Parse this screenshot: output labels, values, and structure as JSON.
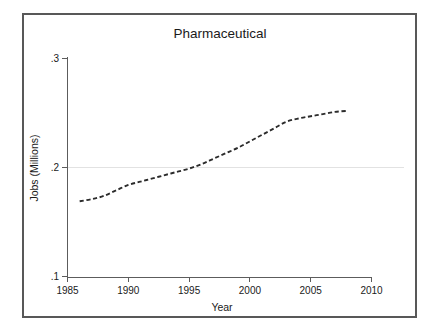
{
  "chart_data": {
    "type": "line",
    "title": "Pharmaceutical",
    "xlabel": "Year",
    "ylabel": "Jobs (Millions)",
    "xlim": [
      1985,
      2010
    ],
    "ylim": [
      0.1,
      0.3
    ],
    "xticks": [
      "1985",
      "1990",
      "1995",
      "2000",
      "2005",
      "2010"
    ],
    "xtick_values": [
      1985,
      1990,
      1995,
      2000,
      2005,
      2010
    ],
    "yticks": [
      ".1",
      ".2",
      ".3"
    ],
    "ytick_values": [
      0.1,
      0.2,
      0.3
    ],
    "grid": "horizontal-gridline-at-0.2-only",
    "legend": "none",
    "line_style": "dashed",
    "line_color": "#2b2b2b",
    "series": [
      {
        "name": "Pharmaceutical jobs",
        "x": [
          1986,
          1987,
          1988,
          1989,
          1990,
          1991,
          1992,
          1993,
          1994,
          1995,
          1996,
          1997,
          1998,
          1999,
          2000,
          2001,
          2002,
          2003,
          2004,
          2005,
          2006,
          2007,
          2008
        ],
        "values": [
          0.169,
          0.171,
          0.174,
          0.179,
          0.184,
          0.187,
          0.19,
          0.193,
          0.196,
          0.199,
          0.203,
          0.208,
          0.213,
          0.218,
          0.224,
          0.23,
          0.236,
          0.242,
          0.245,
          0.247,
          0.249,
          0.251,
          0.252
        ]
      }
    ]
  },
  "chart_colors": {
    "background": "#ffffff",
    "frame_border": "#585858",
    "axis": "#5c5c5c",
    "gridline": "#e2e2e2",
    "text": "#1a1a1a",
    "series": "#2b2b2b"
  },
  "labels": {
    "title": "Pharmaceutical",
    "x_axis_title": "Year",
    "y_axis_title": "Jobs (Millions)",
    "ytick_0": ".1",
    "ytick_1": ".2",
    "ytick_2": ".3",
    "xtick_0": "1985",
    "xtick_1": "1990",
    "xtick_2": "1995",
    "xtick_3": "2000",
    "xtick_4": "2005",
    "xtick_5": "2010"
  }
}
